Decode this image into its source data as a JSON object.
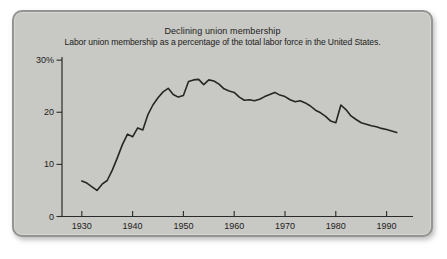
{
  "figure": {
    "kind": "scanned textbook line chart panel"
  },
  "colors": {
    "page_bg": "#ffffff",
    "panel_bg": "#c8c8c4",
    "panel_border": "#949492",
    "axis": "#2b2b29",
    "tick_text": "#222220",
    "data_line": "#262624"
  },
  "chart_data": {
    "type": "line",
    "title": "Declining union membership",
    "subtitle": "Labor union membership as a percentage of the total labor force in the United States.",
    "xlabel": "",
    "ylabel": "",
    "grid": false,
    "legend": false,
    "xlim": [
      1926.1,
      1995.2
    ],
    "ylim": [
      0,
      30.6
    ],
    "x_ticks": [
      {
        "value": 1930,
        "label": "1930"
      },
      {
        "value": 1940,
        "label": "1940"
      },
      {
        "value": 1950,
        "label": "1950"
      },
      {
        "value": 1960,
        "label": "1960"
      },
      {
        "value": 1970,
        "label": "1970"
      },
      {
        "value": 1980,
        "label": "1980"
      },
      {
        "value": 1990,
        "label": "1990"
      }
    ],
    "y_ticks": [
      {
        "value": 0,
        "label": "0"
      },
      {
        "value": 10,
        "label": "10"
      },
      {
        "value": 20,
        "label": "20"
      },
      {
        "value": 30,
        "label": "30%"
      }
    ],
    "series": [
      {
        "name": "Union membership as % of total labor force",
        "x": [
          1930,
          1931,
          1932,
          1933,
          1934,
          1935,
          1936,
          1937,
          1938,
          1939,
          1940,
          1941,
          1942,
          1943,
          1944,
          1945,
          1946,
          1947,
          1948,
          1949,
          1950,
          1951,
          1952,
          1953,
          1954,
          1955,
          1956,
          1957,
          1958,
          1959,
          1960,
          1961,
          1962,
          1963,
          1964,
          1965,
          1966,
          1967,
          1968,
          1969,
          1970,
          1971,
          1972,
          1973,
          1974,
          1975,
          1976,
          1977,
          1978,
          1979,
          1980,
          1981,
          1982,
          1983,
          1984,
          1985,
          1986,
          1987,
          1988,
          1989,
          1990,
          1991,
          1992
        ],
        "y": [
          6.8,
          6.4,
          5.7,
          5.0,
          6.2,
          6.9,
          8.9,
          11.3,
          13.8,
          15.8,
          15.3,
          17.0,
          16.6,
          19.5,
          21.4,
          22.8,
          23.9,
          24.6,
          23.4,
          22.9,
          23.2,
          25.9,
          26.2,
          26.3,
          25.3,
          26.2,
          26.0,
          25.4,
          24.5,
          24.1,
          23.8,
          22.9,
          22.3,
          22.4,
          22.2,
          22.5,
          23.0,
          23.4,
          23.8,
          23.3,
          23.0,
          22.4,
          22.0,
          22.2,
          21.8,
          21.2,
          20.4,
          19.9,
          19.2,
          18.3,
          18.0,
          21.4,
          20.5,
          19.3,
          18.6,
          18.0,
          17.7,
          17.4,
          17.2,
          16.9,
          16.7,
          16.4,
          16.1
        ]
      }
    ]
  }
}
